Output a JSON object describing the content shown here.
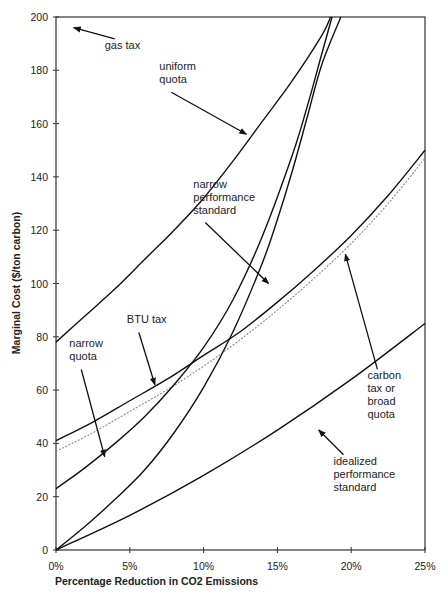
{
  "chart_data": {
    "type": "line",
    "title": "",
    "xlabel": "Percentage Reduction in CO2 Emissions",
    "ylabel": "Marginal Cost ($/ton carbon)",
    "xlim": [
      0,
      25
    ],
    "ylim": [
      0,
      200
    ],
    "x_ticks": [
      0,
      5,
      10,
      15,
      20,
      25
    ],
    "x_tick_labels": [
      "0%",
      "5%",
      "10%",
      "15%",
      "20%",
      "25%"
    ],
    "y_ticks": [
      0,
      20,
      40,
      60,
      80,
      100,
      120,
      140,
      160,
      180,
      200
    ],
    "y_tick_labels": [
      "0",
      "20",
      "40",
      "60",
      "80",
      "100",
      "120",
      "140",
      "160",
      "180",
      "200"
    ],
    "grid": false,
    "legend": "none (inline annotations with arrows)",
    "series": [
      {
        "name": "uniform quota",
        "style": "solid",
        "x": [
          0,
          2,
          4,
          6,
          8,
          10,
          12,
          14,
          16,
          18,
          18.6
        ],
        "y": [
          78,
          88,
          98,
          109,
          120,
          132,
          146,
          161,
          176,
          193,
          200
        ]
      },
      {
        "name": "BTU tax",
        "style": "solid",
        "x": [
          0,
          2.5,
          5,
          7.5,
          10,
          12.5,
          15,
          17.5,
          20,
          22.5,
          25
        ],
        "y": [
          41,
          48,
          56,
          64,
          73,
          82,
          93,
          105,
          118,
          133,
          150
        ]
      },
      {
        "name": "carbon tax or broad quota",
        "style": "dotted",
        "x": [
          0,
          2.5,
          5,
          7.5,
          10,
          12.5,
          15,
          17.5,
          20,
          22.5,
          25
        ],
        "y": [
          37,
          44,
          52,
          60,
          69,
          79,
          90,
          102,
          115,
          130,
          147
        ]
      },
      {
        "name": "narrow quota",
        "style": "solid",
        "x": [
          0,
          2,
          4,
          6,
          8,
          10,
          12,
          14,
          16,
          17,
          18,
          18.7
        ],
        "y": [
          23,
          31,
          40,
          50,
          62,
          76,
          94,
          118,
          148,
          166,
          186,
          200
        ]
      },
      {
        "name": "narrow performance standard",
        "style": "solid",
        "x": [
          0,
          2,
          4,
          6,
          8,
          10,
          12,
          14,
          15,
          16,
          17,
          18,
          19.3
        ],
        "y": [
          0,
          9,
          19,
          30,
          44,
          61,
          82,
          108,
          124,
          142,
          162,
          182,
          200
        ]
      },
      {
        "name": "idealized performance standard",
        "style": "solid",
        "x": [
          0,
          5,
          10,
          15,
          20,
          25
        ],
        "y": [
          0,
          13,
          28,
          45,
          64,
          85
        ]
      }
    ],
    "annotations": [
      {
        "text": [
          "gas tax"
        ],
        "arrow_to": [
          1.2,
          196
        ],
        "text_at": [
          3.3,
          188
        ]
      },
      {
        "text": [
          "uniform",
          "quota"
        ],
        "arrow_to": [
          12.9,
          156
        ],
        "text_at": [
          7.0,
          180
        ]
      },
      {
        "text": [
          "narrow",
          "performance",
          "standard"
        ],
        "arrow_to": [
          14.4,
          100
        ],
        "text_at": [
          9.3,
          136
        ]
      },
      {
        "text": [
          "BTU tax"
        ],
        "arrow_to": [
          6.7,
          62
        ],
        "text_at": [
          4.8,
          85
        ]
      },
      {
        "text": [
          "narrow",
          "quota"
        ],
        "arrow_to": [
          3.3,
          35
        ],
        "text_at": [
          0.9,
          76
        ]
      },
      {
        "text": [
          "carbon",
          "tax or",
          "broad",
          "quota"
        ],
        "arrow_to": [
          19.6,
          111
        ],
        "text_at": [
          21.1,
          64
        ]
      },
      {
        "text": [
          "idealized",
          "performance",
          "standard"
        ],
        "arrow_to": [
          17.8,
          45
        ],
        "text_at": [
          18.8,
          32
        ]
      }
    ]
  }
}
